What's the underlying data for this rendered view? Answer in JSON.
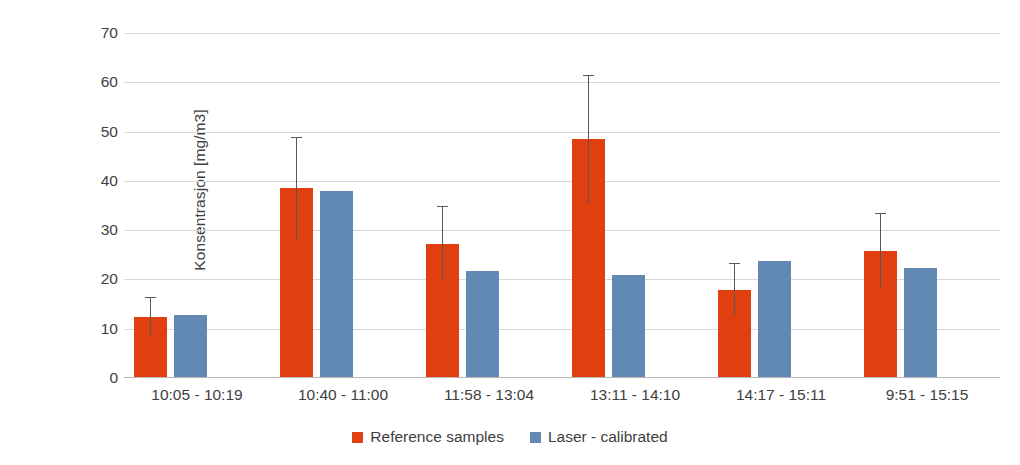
{
  "chart_data": {
    "type": "bar",
    "title": "",
    "xlabel": "",
    "ylabel": "Konsentrasjon [mg/m3]",
    "ylim": [
      0,
      70
    ],
    "ytick_step": 10,
    "yticks": [
      70,
      60,
      50,
      40,
      30,
      20,
      10,
      0
    ],
    "grid": true,
    "legend_position": "bottom-center",
    "categories": [
      "10:05 - 10:19",
      "10:40 - 11:00",
      "11:58 - 13:04",
      "13:11 - 14:10",
      "14:17 - 15:11",
      "9:51 - 15:15"
    ],
    "series": [
      {
        "name": "Reference samples",
        "color": "#e0400f",
        "values": [
          12.4,
          38.5,
          27.2,
          48.5,
          17.8,
          25.7
        ],
        "error_low": [
          8.3,
          28.0,
          19.7,
          35.4,
          12.8,
          18.5
        ],
        "error_high": [
          16.2,
          48.7,
          34.8,
          61.2,
          23.2,
          33.3
        ]
      },
      {
        "name": "Laser - calibrated",
        "color": "#6189b4",
        "values": [
          12.8,
          38.0,
          21.8,
          21.0,
          23.8,
          22.3
        ]
      }
    ]
  },
  "legend": {
    "items": [
      {
        "label": "Reference samples",
        "color": "#e0400f",
        "swatch": "legend-swatch-reference"
      },
      {
        "label": "Laser - calibrated",
        "color": "#6189b4",
        "swatch": "legend-swatch-laser"
      }
    ]
  },
  "axes": {
    "y_title": "Konsentrasjon [mg/m3]",
    "y_tick_labels": [
      "70",
      "60",
      "50",
      "40",
      "30",
      "20",
      "10",
      "0"
    ],
    "x_tick_labels": [
      "10:05 - 10:19",
      "10:40 - 11:00",
      "11:58 - 13:04",
      "13:11 - 14:10",
      "14:17 - 15:11",
      "9:51 - 15:15"
    ]
  },
  "colors": {
    "reference": "#e0400f",
    "laser": "#6189b4",
    "grid": "#d9d9d9",
    "axis": "#b7b7b7",
    "text": "#404040",
    "error_bar": "#595959",
    "background": "#ffffff"
  }
}
